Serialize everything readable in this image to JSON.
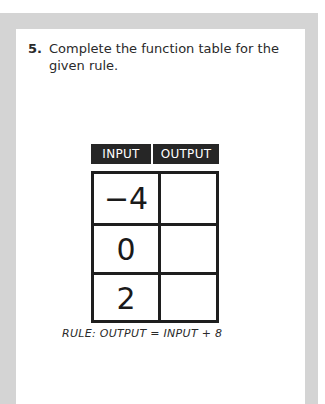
{
  "question": {
    "number": "5.",
    "text": "Complete the function table for the given rule."
  },
  "table": {
    "headers": {
      "input": "INPUT",
      "output": "OUTPUT"
    },
    "rows": [
      {
        "input": "−4",
        "output": ""
      },
      {
        "input": "0",
        "output": ""
      },
      {
        "input": "2",
        "output": ""
      }
    ]
  },
  "rule": "RULE: OUTPUT = INPUT + 8",
  "colors": {
    "frame": "#d4d4d4",
    "header_bg": "#262626",
    "border": "#1e1e1e"
  }
}
